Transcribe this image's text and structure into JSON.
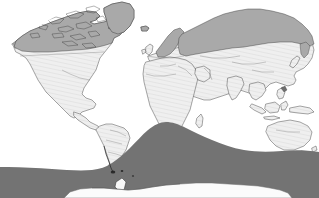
{
  "figure": {
    "name": "world-distribution-map",
    "type": "thematic world map",
    "projection": "equirectangular",
    "caption": "",
    "title": ""
  },
  "colors": {
    "ocean_background": "#ffffff",
    "land_base": "#eeeeee",
    "land_hatch_line": "#d2d2d2",
    "northern_range_fill": "#a9a9a9",
    "southern_ocean_band_fill": "#737373",
    "antarctica_fill": "#fbfbfb",
    "coastline_stroke": "#3a3a3a",
    "border_stroke": "#5c5c5c"
  },
  "legend": {
    "visible": false,
    "entries": [
      {
        "swatch": "#a9a9a9",
        "label": ""
      },
      {
        "swatch": "#737373",
        "label": ""
      },
      {
        "swatch": "#eeeeee",
        "label": ""
      }
    ]
  },
  "axes": {
    "visible": false,
    "lon_range": [
      -180,
      180
    ],
    "lat_range": [
      -90,
      90
    ],
    "graticule": false,
    "tick_labels": []
  },
  "regions": {
    "land_light": [
      "North America (south of boreal line)",
      "Central America",
      "South America",
      "Africa",
      "Europe (south of Fennoscandia)",
      "Asia (south of Siberian line)",
      "India",
      "Southeast Asia",
      "Indonesia",
      "Australia",
      "New Zealand",
      "Japan",
      "Madagascar",
      "British Isles"
    ],
    "northern_shaded": [
      "Alaska",
      "Northern Canada",
      "Canadian Arctic Archipelago",
      "Greenland",
      "Iceland",
      "Fennoscandia",
      "Northern Russia",
      "Siberia",
      "Kamchatka"
    ],
    "southern_band": [
      "Southern Ocean",
      "Sub-Antarctic waters"
    ],
    "white_polar": [
      "Antarctica"
    ],
    "small_dark_markers": [
      "Tierra del Fuego",
      "Falkland Islands",
      "South Georgia",
      "New Guinea highlands"
    ]
  },
  "annotations": []
}
